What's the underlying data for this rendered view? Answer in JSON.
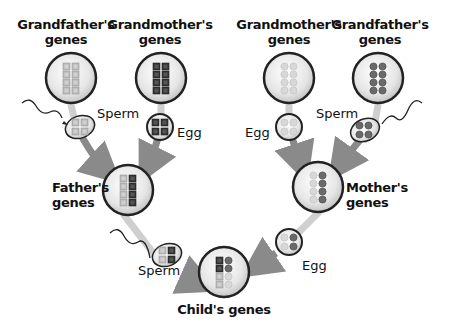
{
  "diagram": {
    "type": "inheritance-pedigree",
    "nodes": {
      "paternal_grandfather": {
        "label_line1": "Grandfather's",
        "label_line2": "genes",
        "pattern": "light-squares"
      },
      "paternal_grandmother": {
        "label_line1": "Grandmother's",
        "label_line2": "genes",
        "pattern": "dark-squares"
      },
      "maternal_grandmother": {
        "label_line1": "Grandmother's",
        "label_line2": "genes",
        "pattern": "light-circles"
      },
      "maternal_grandfather": {
        "label_line1": "Grandfather's",
        "label_line2": "genes",
        "pattern": "dark-circles"
      },
      "father": {
        "label_line1": "Father's",
        "label_line2": "genes",
        "pattern": "light-squares + dark-squares"
      },
      "mother": {
        "label_line1": "Mother's",
        "label_line2": "genes",
        "pattern": "light-circles + dark-circles"
      },
      "child": {
        "label": "Child's genes",
        "pattern": "2 dark-squares, 2 dark-circles, 2 light-squares, 2 light-circles"
      }
    },
    "gametes": {
      "pg_sperm": "Sperm",
      "pgm_egg": "Egg",
      "mgm_egg": "Egg",
      "mg_sperm": "Sperm",
      "father_sperm": "Sperm",
      "mother_egg": "Egg"
    },
    "colors": {
      "arrow": "#8a8a8a",
      "stem": "#c8c8c8",
      "circle_border": "#222222",
      "circle_fill": "#e9e9e9",
      "light_gene": "#b5b5b5",
      "dark_gene": "#3a3a3a",
      "mid_circle_gene": "#6a6a6a"
    }
  }
}
